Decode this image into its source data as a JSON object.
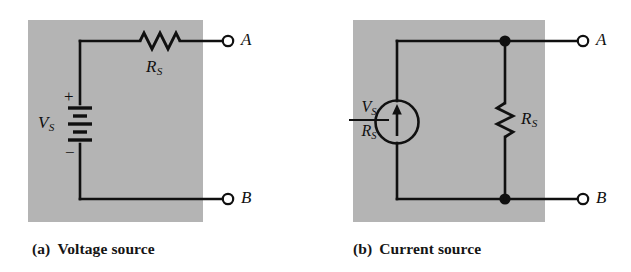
{
  "figure": {
    "background_color": "#ffffff",
    "panel_fill": "#b4b4b4",
    "wire_color": "#101010",
    "text_color": "#101010"
  },
  "panels": [
    {
      "id": "voltage-source",
      "caption_tag": "(a)",
      "caption_text": "Voltage source",
      "source_label": "V",
      "source_sub": "S",
      "resistor_label": "R",
      "resistor_sub": "S",
      "plus_sign": "+",
      "minus_sign": "−",
      "terminal_top": "A",
      "terminal_bottom": "B",
      "source_symbol": "battery-symbol",
      "resistor_symbol": "resistor-zigzag-horizontal"
    },
    {
      "id": "current-source",
      "caption_tag": "(b)",
      "caption_text": "Current source",
      "source_numerator": "V",
      "source_numerator_sub": "S",
      "source_denominator": "R",
      "source_denominator_sub": "S",
      "resistor_label": "R",
      "resistor_sub": "S",
      "terminal_top": "A",
      "terminal_bottom": "B",
      "source_symbol": "current-source-circle-arrow-up",
      "resistor_symbol": "resistor-zigzag-vertical",
      "junctions": [
        "node-dot-top",
        "node-dot-bottom"
      ]
    }
  ]
}
